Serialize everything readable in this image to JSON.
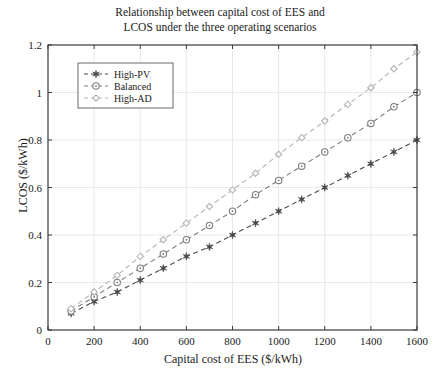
{
  "chart_data": {
    "type": "line",
    "title": "Relationship between capital cost of EES and LCOS under the three operating scenarios",
    "title_line1": "Relationship between capital cost of EES and",
    "title_line2": "LCOS under the three operating scenarios",
    "xlabel": "Capital cost of EES ($/kWh)",
    "ylabel": "LCOS ($/kWh)",
    "xlim": [
      0,
      1600
    ],
    "ylim": [
      0,
      1.2
    ],
    "xticks": [
      0,
      200,
      400,
      600,
      800,
      1000,
      1200,
      1400,
      1600
    ],
    "xticklabels": [
      "0",
      "200",
      "400",
      "600",
      "800",
      "1000",
      "1200",
      "1400",
      "1600"
    ],
    "yticks": [
      0,
      0.2,
      0.4,
      0.6,
      0.8,
      1,
      1.2
    ],
    "yticklabels": [
      "0",
      "0.2",
      "0.4",
      "0.6",
      "0.8",
      "1",
      "1.2"
    ],
    "grid": true,
    "legend_position": "upper left",
    "x": [
      100,
      200,
      300,
      400,
      500,
      600,
      700,
      800,
      900,
      1000,
      1100,
      1200,
      1300,
      1400,
      1500,
      1600
    ],
    "series": [
      {
        "name": "High-PV",
        "marker": "hexagram",
        "color": "#4a4a4a",
        "linestyle": "dashed",
        "values": [
          0.07,
          0.12,
          0.16,
          0.21,
          0.26,
          0.31,
          0.35,
          0.4,
          0.45,
          0.5,
          0.55,
          0.6,
          0.65,
          0.7,
          0.75,
          0.8
        ]
      },
      {
        "name": "Balanced",
        "marker": "circle-dot",
        "color": "#7d7d7d",
        "linestyle": "dashed",
        "values": [
          0.08,
          0.14,
          0.2,
          0.26,
          0.32,
          0.38,
          0.44,
          0.5,
          0.57,
          0.63,
          0.69,
          0.75,
          0.81,
          0.87,
          0.94,
          1.0
        ]
      },
      {
        "name": "High-AD",
        "marker": "diamond",
        "color": "#b5b5b5",
        "linestyle": "dashed",
        "values": [
          0.09,
          0.16,
          0.23,
          0.31,
          0.38,
          0.45,
          0.52,
          0.59,
          0.66,
          0.74,
          0.81,
          0.88,
          0.95,
          1.02,
          1.1,
          1.17
        ]
      }
    ],
    "legend_entries": [
      "High-PV",
      "Balanced",
      "High-AD"
    ]
  },
  "colors": {
    "axis": "#3a3a3a",
    "grid": "#e3e3e3",
    "background": "#ffffff",
    "text": "#1a1a1a"
  }
}
